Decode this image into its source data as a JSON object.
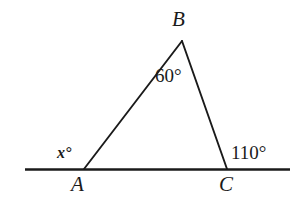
{
  "figure": {
    "kind": "geometry-diagram",
    "background_color": "#ffffff",
    "stroke_color": "#1a1a1a",
    "width": 298,
    "height": 207
  },
  "vertices": {
    "A": {
      "label": "A",
      "x": 84,
      "y": 169
    },
    "B": {
      "label": "B",
      "x": 182,
      "y": 41
    },
    "C": {
      "label": "C",
      "x": 227,
      "y": 169
    }
  },
  "baseline": {
    "name": "horizontal-line",
    "x1": 25,
    "y1": 169,
    "x2": 290,
    "y2": 169
  },
  "segments": [
    {
      "name": "segment-AB",
      "x1": 84,
      "y1": 169,
      "x2": 182,
      "y2": 41
    },
    {
      "name": "segment-BC",
      "x1": 182,
      "y1": 41,
      "x2": 227,
      "y2": 169
    }
  ],
  "angles": {
    "at_B": {
      "label": "60°",
      "value": 60,
      "kind": "interior"
    },
    "at_A": {
      "label": "x°",
      "value": "x",
      "kind": "exterior-unknown"
    },
    "at_C": {
      "label": "110°",
      "value": 110,
      "kind": "exterior"
    }
  },
  "chart_data": {
    "type": "diagram",
    "title": "",
    "shape": "triangle",
    "points": [
      {
        "name": "A",
        "x": 84,
        "y": 169
      },
      {
        "name": "B",
        "x": 182,
        "y": 41
      },
      {
        "name": "C",
        "x": 227,
        "y": 169
      }
    ],
    "edges": [
      [
        "A",
        "B"
      ],
      [
        "B",
        "C"
      ]
    ],
    "annotations": [
      {
        "text": "B",
        "x": 180,
        "y": 20
      },
      {
        "text": "A",
        "x": 79,
        "y": 186
      },
      {
        "text": "C",
        "x": 227,
        "y": 186
      },
      {
        "text": "60°",
        "x": 170,
        "y": 78
      },
      {
        "text": "x°",
        "x": 67,
        "y": 155
      },
      {
        "text": "110°",
        "x": 253,
        "y": 154
      }
    ]
  }
}
